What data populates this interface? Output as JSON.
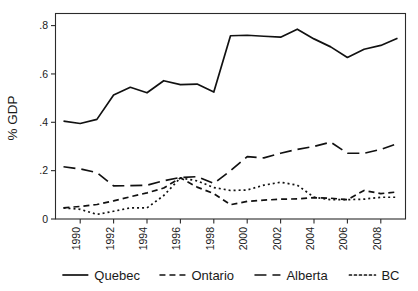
{
  "chart_data": {
    "type": "line",
    "title": "",
    "subtitle": "",
    "xlabel": "",
    "ylabel": "% GDP",
    "x": [
      1989,
      1990,
      1991,
      1992,
      1993,
      1994,
      1995,
      1996,
      1997,
      1998,
      1999,
      2000,
      2001,
      2002,
      2003,
      2004,
      2005,
      2006,
      2007,
      2008,
      2009
    ],
    "xlim": [
      1989,
      2009
    ],
    "ylim": [
      0,
      0.85
    ],
    "y_ticks": [
      0,
      0.2,
      0.4,
      0.6,
      0.8
    ],
    "y_tick_labels": [
      "0",
      ".2",
      ".4",
      ".6",
      ".8"
    ],
    "x_ticks": [
      1990,
      1992,
      1994,
      1996,
      1998,
      2000,
      2002,
      2004,
      2006,
      2008
    ],
    "x_tick_labels": [
      "1990",
      "1992",
      "1994",
      "1996",
      "1998",
      "2000",
      "2002",
      "2004",
      "2006",
      "2008"
    ],
    "x_tick_rotation": 90,
    "grid": false,
    "legend_position": "bottom",
    "series": [
      {
        "name": "Quebec",
        "style": "solid",
        "dash": "none",
        "color": "#111111",
        "values": [
          0.405,
          0.395,
          0.412,
          0.513,
          0.545,
          0.522,
          0.572,
          0.556,
          0.558,
          0.525,
          0.758,
          0.76,
          0.756,
          0.752,
          0.785,
          0.745,
          0.712,
          0.668,
          0.702,
          0.718,
          0.748
        ]
      },
      {
        "name": "Ontario",
        "style": "dashed-short",
        "dash": "6,4",
        "color": "#111111",
        "values": [
          0.046,
          0.052,
          0.06,
          0.075,
          0.092,
          0.108,
          0.128,
          0.17,
          0.132,
          0.105,
          0.059,
          0.073,
          0.078,
          0.082,
          0.083,
          0.088,
          0.086,
          0.08,
          0.118,
          0.105,
          0.112
        ]
      },
      {
        "name": "Alberta",
        "style": "dashed-long",
        "dash": "12,6",
        "color": "#111111",
        "values": [
          0.216,
          0.207,
          0.192,
          0.137,
          0.138,
          0.14,
          0.158,
          0.172,
          0.175,
          0.147,
          0.2,
          0.258,
          0.253,
          0.272,
          0.288,
          0.3,
          0.318,
          0.272,
          0.272,
          0.288,
          0.312
        ]
      },
      {
        "name": "BC",
        "style": "dotted",
        "dash": "2,3",
        "color": "#111111",
        "values": [
          0.046,
          0.04,
          0.019,
          0.032,
          0.046,
          0.046,
          0.097,
          0.17,
          0.158,
          0.13,
          0.118,
          0.12,
          0.14,
          0.152,
          0.14,
          0.09,
          0.08,
          0.08,
          0.082,
          0.09,
          0.09
        ]
      }
    ]
  },
  "legend": {
    "entries": [
      {
        "label": "Quebec",
        "swatch": "solid-line-swatch"
      },
      {
        "label": "Ontario",
        "swatch": "short-dash-line-swatch"
      },
      {
        "label": "Alberta",
        "swatch": "long-dash-line-swatch"
      },
      {
        "label": "BC",
        "swatch": "dotted-line-swatch"
      }
    ]
  },
  "axes": {
    "y_title": "% GDP"
  }
}
